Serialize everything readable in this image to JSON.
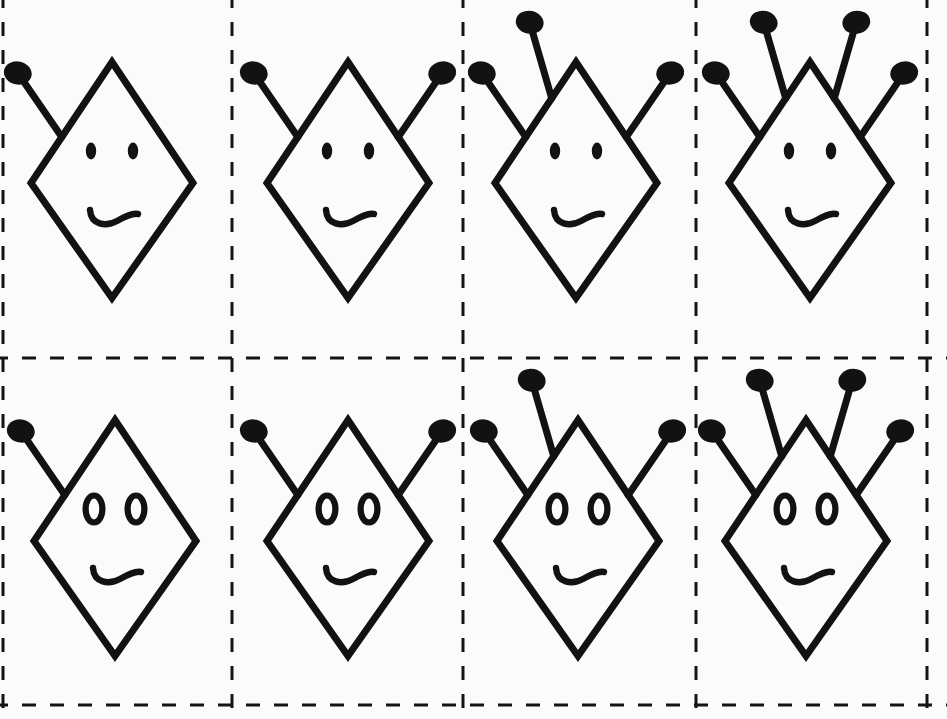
{
  "canvas": {
    "width": 947,
    "height": 719,
    "background_color": "#fbfbfb",
    "ink_color": "#121212"
  },
  "grid": {
    "name": "dashed-cut-grid",
    "rows": 2,
    "cols": 4,
    "line_style": "dashed",
    "line_color": "#141414",
    "line_width": 3,
    "dash_pattern": "14 14",
    "vertical_lines_x": [
      3,
      232,
      463,
      696,
      927
    ],
    "horizontal_lines_y": [
      -4,
      358,
      705
    ],
    "border_visible": true
  },
  "figure_defaults": {
    "stroke_color": "#121212",
    "stroke_width": 7,
    "diamond_half_width": 81,
    "diamond_top_offset": -121,
    "diamond_bottom_offset": 115,
    "antenna_length": 78,
    "bulb_rx": 14,
    "bulb_ry": 11.5,
    "eye_offset_x": 21,
    "eye_offset_y": -32,
    "mouth_offset_y": 33
  },
  "chart_data": {
    "type": "table",
    "xlabel": "Number of antennae",
    "ylabel": "Eye style",
    "categories": [
      "1 antenna",
      "2 antennae",
      "3 antennae",
      "4 antennae"
    ],
    "series": [
      {
        "name": "solid eyes",
        "values": [
          1,
          2,
          3,
          4
        ]
      },
      {
        "name": "ring eyes",
        "values": [
          1,
          2,
          3,
          4
        ]
      }
    ],
    "legend": [
      "row 1: solid filled oval eyes",
      "row 2: hollow ring oval eyes"
    ],
    "grid": true
  },
  "cells": [
    {
      "id": "cell-r1c1",
      "row": 1,
      "col": 1,
      "label": "1 antenna, solid eyes",
      "center_x": 112,
      "center_y": 183,
      "antenna_count": 1,
      "antennas": [
        "outer-left"
      ],
      "eye_style": "solid",
      "mouth": "wavy"
    },
    {
      "id": "cell-r1c2",
      "row": 1,
      "col": 2,
      "label": "2 antennae, solid eyes",
      "center_x": 348,
      "center_y": 183,
      "antenna_count": 2,
      "antennas": [
        "outer-left",
        "outer-right"
      ],
      "eye_style": "solid",
      "mouth": "wavy"
    },
    {
      "id": "cell-r1c3",
      "row": 1,
      "col": 3,
      "label": "3 antennae, solid eyes",
      "center_x": 576,
      "center_y": 183,
      "antenna_count": 3,
      "antennas": [
        "outer-left",
        "inner-left",
        "outer-right"
      ],
      "eye_style": "solid",
      "mouth": "wavy"
    },
    {
      "id": "cell-r1c4",
      "row": 1,
      "col": 4,
      "label": "4 antennae, solid eyes",
      "center_x": 810,
      "center_y": 183,
      "antenna_count": 4,
      "antennas": [
        "outer-left",
        "inner-left",
        "inner-right",
        "outer-right"
      ],
      "eye_style": "solid",
      "mouth": "wavy"
    },
    {
      "id": "cell-r2c1",
      "row": 2,
      "col": 1,
      "label": "1 antenna, ring eyes",
      "center_x": 115,
      "center_y": 541,
      "antenna_count": 1,
      "antennas": [
        "outer-left"
      ],
      "eye_style": "ring",
      "mouth": "wavy"
    },
    {
      "id": "cell-r2c2",
      "row": 2,
      "col": 2,
      "label": "2 antennae, ring eyes",
      "center_x": 348,
      "center_y": 541,
      "antenna_count": 2,
      "antennas": [
        "outer-left",
        "outer-right"
      ],
      "eye_style": "ring",
      "mouth": "wavy"
    },
    {
      "id": "cell-r2c3",
      "row": 2,
      "col": 3,
      "label": "3 antennae, ring eyes",
      "center_x": 578,
      "center_y": 541,
      "antenna_count": 3,
      "antennas": [
        "outer-left",
        "inner-left",
        "outer-right"
      ],
      "eye_style": "ring",
      "mouth": "wavy"
    },
    {
      "id": "cell-r2c4",
      "row": 2,
      "col": 4,
      "label": "4 antennae, ring eyes",
      "center_x": 806,
      "center_y": 541,
      "antenna_count": 4,
      "antennas": [
        "outer-left",
        "inner-left",
        "inner-right",
        "outer-right"
      ],
      "eye_style": "ring",
      "mouth": "wavy"
    }
  ]
}
